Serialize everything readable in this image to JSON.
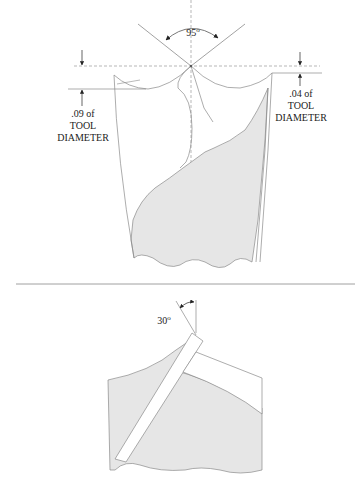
{
  "top_view": {
    "point_angle": {
      "value": "95",
      "unit": "o"
    },
    "left_dimension": {
      "line1": ".09 of",
      "line2": "TOOL",
      "line3": "DIAMETER"
    },
    "right_dimension": {
      "line1": ".04 of",
      "line2": "TOOL",
      "line3": "DIAMETER"
    }
  },
  "bottom_view": {
    "helix_angle": {
      "value": "30",
      "unit": "o"
    }
  },
  "colors": {
    "shade": "#e6e6e6",
    "line": "#8a8a8a",
    "dark_line": "#555555",
    "dash": "#999999"
  }
}
